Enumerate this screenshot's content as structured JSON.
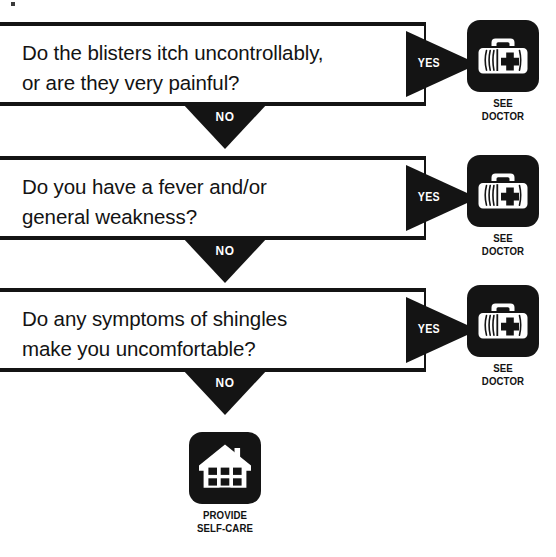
{
  "diagram": {
    "type": "decision-flowchart",
    "steps": [
      {
        "id": "q1",
        "question_lines": [
          "Do the blisters itch uncontrollably,",
          "or are they very painful?"
        ],
        "yes_label": "YES",
        "no_label": "NO",
        "yes_outcome": {
          "icon": "doctor-bag-icon",
          "label_lines": [
            "SEE",
            "DOCTOR"
          ]
        }
      },
      {
        "id": "q2",
        "question_lines": [
          "Do you have a fever and/or",
          "general weakness?"
        ],
        "yes_label": "YES",
        "no_label": "NO",
        "yes_outcome": {
          "icon": "doctor-bag-icon",
          "label_lines": [
            "SEE",
            "DOCTOR"
          ]
        }
      },
      {
        "id": "q3",
        "question_lines": [
          "Do any symptoms of shingles",
          "make you uncomfortable?"
        ],
        "yes_label": "YES",
        "no_label": "NO",
        "yes_outcome": {
          "icon": "doctor-bag-icon",
          "label_lines": [
            "SEE",
            "DOCTOR"
          ]
        }
      }
    ],
    "final_outcome": {
      "icon": "house-icon",
      "label_lines": [
        "PROVIDE",
        "SELF-CARE"
      ]
    },
    "colors": {
      "ink": "#141414",
      "paper": "#ffffff",
      "arrow_text": "#ffffff"
    }
  }
}
